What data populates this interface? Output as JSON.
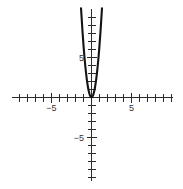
{
  "chart_data": {
    "type": "line",
    "title": "",
    "subtitle": "",
    "xlabel": "",
    "ylabel": "",
    "xlim": [
      -9.9,
      10.1
    ],
    "ylim": [
      -10.3,
      11.0
    ],
    "grid": false,
    "legend": null,
    "axes": {
      "x_axis_label_values": [
        -5,
        5
      ],
      "y_axis_label_values": [
        5,
        -5
      ],
      "tick_interval": 1,
      "x_tick_values": [
        -9,
        -8,
        -7,
        -6,
        -5,
        -4,
        -3,
        -2,
        -1,
        1,
        2,
        3,
        4,
        5,
        6,
        7,
        8,
        9,
        10
      ],
      "y_tick_values": [
        10,
        9,
        8,
        7,
        6,
        5,
        4,
        3,
        2,
        1,
        -1,
        -2,
        -3,
        -4,
        -5,
        -6,
        -7,
        -8,
        -9,
        -10
      ]
    },
    "series": [
      {
        "name": "parabola",
        "equation": "y = 6.5x^2",
        "vertex": [
          0,
          0
        ],
        "opens": "up",
        "color": "#141414",
        "x": [
          -1.31,
          -1.18,
          -1.05,
          -0.92,
          -0.79,
          -0.66,
          -0.52,
          -0.39,
          -0.26,
          -0.13,
          0,
          0.13,
          0.26,
          0.39,
          0.52,
          0.66,
          0.79,
          0.92,
          1.05,
          1.18,
          1.31
        ],
        "values": [
          11.15,
          9.05,
          7.17,
          5.5,
          4.06,
          2.83,
          1.76,
          0.99,
          0.44,
          0.11,
          0,
          0.11,
          0.44,
          0.99,
          1.76,
          2.83,
          4.06,
          5.5,
          7.17,
          9.05,
          11.15
        ]
      }
    ]
  },
  "labels": {
    "x_neg_five": "−5",
    "x_pos_five": "5",
    "y_pos_five": "5",
    "y_neg_five": "−5"
  },
  "colors": {
    "background": "#ffffff",
    "axis": "#2b2b2b",
    "curve": "#141414",
    "text": "#333333"
  }
}
